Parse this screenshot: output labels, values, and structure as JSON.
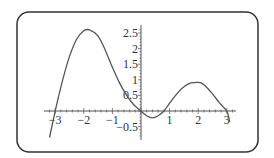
{
  "chart_data": {
    "type": "line",
    "title": "",
    "xlabel": "",
    "ylabel": "",
    "xlim": [
      -3.2,
      3.2
    ],
    "ylim": [
      -0.85,
      2.7
    ],
    "grid": false,
    "legend": null,
    "x_ticks": [
      "-3",
      "-2",
      "-1",
      "1",
      "2",
      "3"
    ],
    "y_ticks": [
      "2.5",
      "2",
      "1.5",
      "1",
      "0.5",
      "-0.5"
    ],
    "series": [
      {
        "name": "f(x)",
        "x": [
          -3.2,
          -3.0,
          -2.75,
          -2.5,
          -2.25,
          -2.0,
          -1.8,
          -1.5,
          -1.25,
          -1.0,
          -0.75,
          -0.5,
          -0.25,
          0.0,
          0.2,
          0.4,
          0.6,
          0.8,
          1.0,
          1.25,
          1.5,
          1.75,
          2.0,
          2.1,
          2.25,
          2.5,
          2.75,
          3.0,
          3.1
        ],
        "values": [
          -0.85,
          0.0,
          0.95,
          1.75,
          2.3,
          2.57,
          2.6,
          2.4,
          1.95,
          1.4,
          0.9,
          0.5,
          0.2,
          0.0,
          -0.15,
          -0.22,
          -0.15,
          0.0,
          0.25,
          0.55,
          0.78,
          0.9,
          0.92,
          0.9,
          0.8,
          0.55,
          0.25,
          0.0,
          -0.35
        ]
      }
    ]
  },
  "axes": {
    "x_labels": [
      {
        "text": "-3",
        "value": -3
      },
      {
        "text": "-2",
        "value": -2
      },
      {
        "text": "-1",
        "value": -1
      },
      {
        "text": "1",
        "value": 1
      },
      {
        "text": "2",
        "value": 2
      },
      {
        "text": "3",
        "value": 3
      }
    ],
    "y_labels": [
      {
        "text": "2.5",
        "value": 2.5
      },
      {
        "text": "2",
        "value": 2
      },
      {
        "text": "1.5",
        "value": 1.5
      },
      {
        "text": "1",
        "value": 1
      },
      {
        "text": "0.5",
        "value": 0.5
      },
      {
        "text": "-0.5",
        "value": -0.5
      }
    ]
  },
  "colors": {
    "frame": "#333333",
    "axis": "#555555",
    "curve": "#555555",
    "text": "#333333"
  }
}
